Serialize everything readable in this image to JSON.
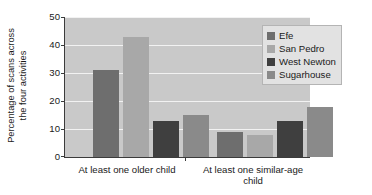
{
  "chart_data": {
    "type": "bar",
    "title": "",
    "xlabel": "",
    "ylabel": "Percentage of scans across the four activities",
    "ylabel_line1": "Percentage of scans across",
    "ylabel_line2": "the four activities",
    "categories": [
      "At least one older child",
      "At least one similar-age child"
    ],
    "category_lines": [
      [
        "At least one older child"
      ],
      [
        "At least one similar-age",
        "child"
      ]
    ],
    "series": [
      {
        "name": "Efe",
        "color": "#6e6e6e",
        "values": [
          31,
          9
        ]
      },
      {
        "name": "San Pedro",
        "color": "#a8a8a8",
        "values": [
          43,
          8
        ]
      },
      {
        "name": "West Newton",
        "color": "#3f3f3f",
        "values": [
          13,
          13
        ]
      },
      {
        "name": "Sugarhouse",
        "color": "#8a8a8a",
        "values": [
          15,
          18
        ]
      }
    ],
    "ylim": [
      0,
      50
    ],
    "yticks": [
      0,
      10,
      20,
      30,
      40,
      50
    ],
    "ytick_labels": [
      "0",
      "10",
      "20",
      "30",
      "40",
      "50"
    ],
    "grid": true,
    "grid_color": "#f2f2f2",
    "plot_background": "#c9c9c9",
    "legend_position": "top-right",
    "legend_entries": [
      "Efe",
      "San Pedro",
      "West Newton",
      "Sugarhouse"
    ]
  }
}
